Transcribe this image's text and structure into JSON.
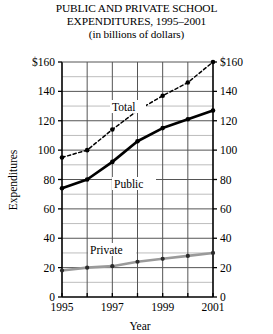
{
  "chart_data": {
    "type": "line",
    "title": "PUBLIC AND PRIVATE SCHOOL EXPENDITURES, 1995–2001",
    "title_lines": [
      "PUBLIC AND PRIVATE SCHOOL",
      "EXPENDITURES, 1995–2001",
      "(in billions of dollars)"
    ],
    "subtitle": "(in billions of dollars)",
    "xlabel": "Year",
    "ylabel": "Expenditures",
    "x": [
      1995,
      1996,
      1997,
      1998,
      1999,
      2000,
      2001
    ],
    "xlim": [
      1995,
      2001
    ],
    "ylim": [
      0,
      160
    ],
    "grid": true,
    "legend_position": "inline-labels",
    "x_tick_labels": [
      "1995",
      "",
      "1997",
      "",
      "1999",
      "",
      "2001"
    ],
    "x_ticks_all": [
      "1995",
      "1996",
      "1997",
      "1998",
      "1999",
      "2000",
      "2001"
    ],
    "y_ticks": [
      0,
      20,
      40,
      60,
      80,
      100,
      120,
      140,
      160
    ],
    "y_tick_labels_left": [
      "0",
      "20",
      "40",
      "60",
      "80",
      "100",
      "120",
      "140",
      "$160"
    ],
    "y_tick_labels_right": [
      "0",
      "20",
      "40",
      "60",
      "80",
      "100",
      "120",
      "140",
      "$160"
    ],
    "y_minor_ticks": [
      10,
      30,
      50,
      70,
      90,
      110,
      130,
      150
    ],
    "series": [
      {
        "name": "Total",
        "label": "Total",
        "style": "dashed",
        "color": "#000000",
        "marker": "circle",
        "values": [
          95,
          100,
          114,
          127,
          137,
          146,
          160
        ]
      },
      {
        "name": "Public",
        "label": "Public",
        "style": "solid-thick",
        "color": "#000000",
        "marker": "circle",
        "values": [
          74,
          80,
          92,
          106,
          115,
          121,
          127
        ]
      },
      {
        "name": "Private",
        "label": "Private",
        "style": "solid-gray",
        "color": "#9a9a9a",
        "marker": "circle",
        "values": [
          18,
          20,
          21,
          24,
          26,
          28,
          30
        ]
      }
    ]
  },
  "colors": {
    "axis": "#000000",
    "grid_major": "#555555",
    "grid_minor": "#bdbdbd",
    "total_series": "#000000",
    "public_series": "#000000",
    "private_series": "#9a9a9a",
    "background": "#ffffff"
  }
}
